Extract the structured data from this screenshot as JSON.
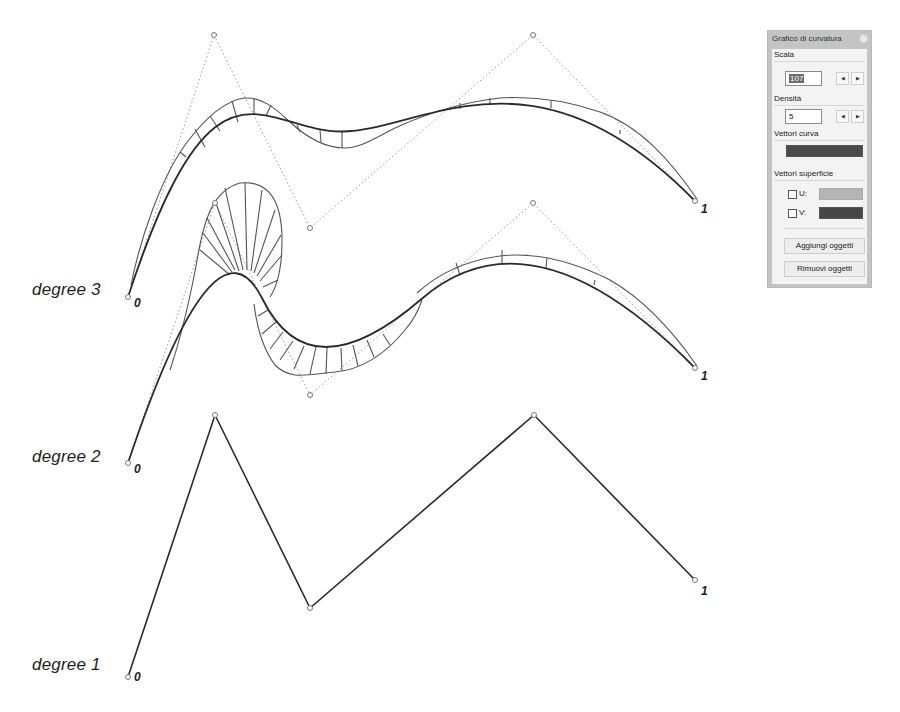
{
  "diagram": {
    "curves": [
      {
        "label": "degree 3",
        "start_label": "0",
        "end_label": "1",
        "control_points": [
          [
            128,
            297
          ],
          [
            214,
            35
          ],
          [
            310,
            228
          ],
          [
            533,
            35
          ],
          [
            695,
            201
          ]
        ]
      },
      {
        "label": "degree 2",
        "start_label": "0",
        "end_label": "1",
        "control_points": [
          [
            128,
            463
          ],
          [
            215,
            203
          ],
          [
            310,
            395
          ],
          [
            533,
            203
          ],
          [
            695,
            368
          ]
        ]
      },
      {
        "label": "degree 1",
        "start_label": "0",
        "end_label": "1",
        "control_points": [
          [
            128,
            677
          ],
          [
            215,
            415
          ],
          [
            310,
            608
          ],
          [
            534,
            415
          ],
          [
            695,
            580
          ]
        ]
      }
    ]
  },
  "panel": {
    "title": "Grafico di curvatura",
    "scale_label": "Scala",
    "scale_value": "107",
    "density_label": "Densità",
    "density_value": "5",
    "stepper_left": "◀",
    "stepper_right": "▶",
    "curve_vectors_label": "Vettori curva",
    "curve_vectors_color": "#4a4a4a",
    "surface_vectors_label": "Vettori superficie",
    "u_label": "U:",
    "u_color": "#b5b5b5",
    "u_checked": false,
    "v_label": "V:",
    "v_color": "#474747",
    "v_checked": false,
    "add_objects": "Aggiungi oggetti",
    "remove_objects": "Rimuovi oggetti"
  }
}
